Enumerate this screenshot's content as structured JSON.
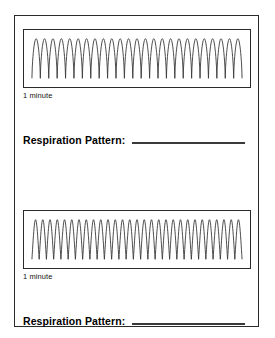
{
  "page": {
    "background_color": "#ffffff",
    "frame_color": "#2b2b2b",
    "trace_color": "#3a3a3a"
  },
  "sections": [
    {
      "duration_label": "1 minute",
      "prompt_label": "Respiration Pattern:",
      "answer_value": ""
    },
    {
      "duration_label": "1 minute",
      "prompt_label": "Respiration Pattern:",
      "answer_value": ""
    }
  ],
  "chart_data": [
    {
      "type": "line",
      "title": "",
      "xlabel": "1 minute",
      "ylabel": "",
      "series_name": "respiration-trace-1",
      "waveform": "rounded-peaks",
      "cycles": 25,
      "duration_minutes": 1,
      "breaths_per_minute": 25,
      "amplitude_relative": 1.0,
      "baseline_relative": 0.0,
      "x": [
        0,
        1
      ],
      "xlim": [
        0,
        1
      ],
      "ylim": [
        0,
        1
      ],
      "grid": false,
      "legend": "none"
    },
    {
      "type": "line",
      "title": "",
      "xlabel": "1 minute",
      "ylabel": "",
      "series_name": "respiration-trace-2",
      "waveform": "sharp-peaks",
      "cycles": 29,
      "duration_minutes": 1,
      "breaths_per_minute": 29,
      "amplitude_relative": 1.0,
      "baseline_relative": 0.0,
      "x": [
        0,
        1
      ],
      "xlim": [
        0,
        1
      ],
      "ylim": [
        0,
        1
      ],
      "grid": false,
      "legend": "none"
    }
  ]
}
